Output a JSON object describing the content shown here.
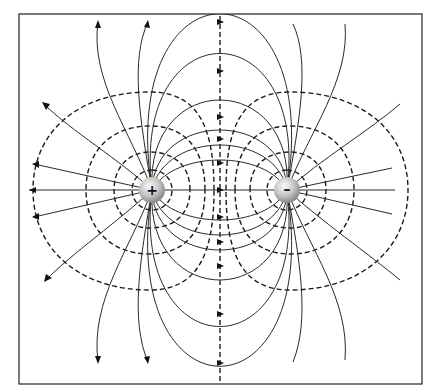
{
  "diagram": {
    "frame": {
      "x": 19,
      "y": 14,
      "width": 403,
      "height": 370
    },
    "colors": {
      "line": "#2a2a2a",
      "dash": "#1a1a1a",
      "frame": "#333333",
      "charge_light": "#f4f4f4",
      "charge_dark": "#8c8c8c"
    },
    "charges": [
      {
        "name": "positive",
        "sign": "+",
        "cx": 152,
        "cy": 190,
        "r": 13
      },
      {
        "name": "negative",
        "sign": "–",
        "cx": 287,
        "cy": 190,
        "r": 13
      }
    ],
    "legend": {
      "solid_lines": "electric field lines",
      "dashed_lines": "equipotential lines"
    },
    "midline_crossings_y": [
      22,
      71,
      117,
      139,
      163,
      190,
      217,
      242,
      266,
      314,
      363
    ],
    "equipotentials": [
      {
        "cx": 152,
        "cy": 190,
        "rx": 20,
        "ry": 20
      },
      {
        "cx": 152,
        "cy": 190,
        "rx": 38,
        "ry": 36
      },
      {
        "cx": 152,
        "cy": 190,
        "rx": 65,
        "ry": 62
      },
      {
        "cx": 152,
        "cy": 190,
        "rx": 122,
        "ry": 100
      },
      {
        "cx": 287,
        "cy": 190,
        "rx": 20,
        "ry": 20
      },
      {
        "cx": 287,
        "cy": 190,
        "rx": 38,
        "ry": 36
      },
      {
        "cx": 287,
        "cy": 190,
        "rx": 65,
        "ry": 62
      },
      {
        "cx": 287,
        "cy": 190,
        "rx": 122,
        "ry": 100
      }
    ]
  }
}
